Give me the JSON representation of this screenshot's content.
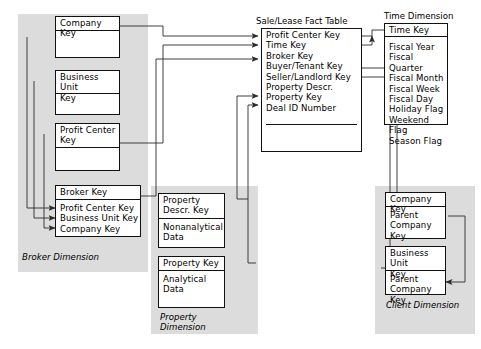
{
  "diagram": {
    "fact_table": {
      "title": "Sale/Lease Fact Table",
      "rows": "Profit Center Key\nTime Key\nBroker Key\nBuyer/Tenant Key\nSeller/Landlord Key\nProperty Descr.\nProperty Key\nDeal ID Number"
    },
    "time_dimension": {
      "caption": "Time Dimension",
      "key": "Time Key",
      "attributes": "Fiscal Year\nFiscal Quarter\nFiscal Month\nFiscal Week\nFiscal Day\nHoliday Flag\nWeekend Flag\nSeason Flag"
    },
    "broker_dimension": {
      "caption": "Broker Dimension",
      "company": "Company Key",
      "business_unit": "Business Unit\nKey",
      "profit_center": "Profit Center\nKey",
      "broker_key": "Broker Key",
      "broker_attrs": "Profit Center Key\nBusiness Unit Key\nCompany Key"
    },
    "property_dimension": {
      "caption": "Property\nDimension",
      "descr_key": "Property\nDescr. Key",
      "descr_body": "Nonanalytical\nData",
      "prop_key": "Property Key",
      "prop_body": "Analytical\nData"
    },
    "client_dimension": {
      "caption": "Client Dimension",
      "company_key": "Company Key",
      "company_parent": "Parent\nCompany Key",
      "bu_key": "Business Unit\nKey",
      "bu_parent": "Parent\nCompany Key"
    }
  }
}
